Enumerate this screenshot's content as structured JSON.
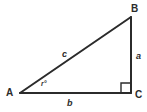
{
  "diagram": {
    "type": "right-triangle",
    "background_color": "#ffffff",
    "stroke_color": "#2b2b2b",
    "label_color": "#2b2b2b",
    "vertices": [
      {
        "name": "A",
        "label": "A",
        "x": 20,
        "y": 93
      },
      {
        "name": "B",
        "label": "B",
        "x": 131,
        "y": 17
      },
      {
        "name": "C",
        "label": "C",
        "x": 131,
        "y": 93
      }
    ],
    "sides": [
      {
        "name": "a",
        "label": "a",
        "between": "B-C",
        "position": "right"
      },
      {
        "name": "b",
        "label": "b",
        "between": "A-C",
        "position": "bottom"
      },
      {
        "name": "c",
        "label": "c",
        "between": "A-B",
        "position": "hypotenuse"
      }
    ],
    "angles": [
      {
        "at": "A",
        "label": "r°",
        "type": "acute"
      },
      {
        "at": "C",
        "label": "",
        "type": "right",
        "marker": "square"
      }
    ]
  }
}
